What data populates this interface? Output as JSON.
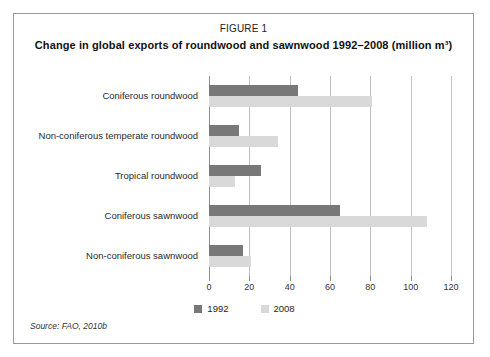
{
  "figure": {
    "number": "FIGURE 1",
    "title": "Change in global exports of roundwood and sawnwood 1992–2008 (million m³)",
    "source": "Source: FAO, 2010b"
  },
  "legend": {
    "items": [
      {
        "label": "1992",
        "color": "#787878"
      },
      {
        "label": "2008",
        "color": "#d9d9d9"
      }
    ]
  },
  "chart_data": {
    "type": "bar",
    "orientation": "horizontal",
    "title": "Change in global exports of roundwood and sawnwood 1992–2008 (million m³)",
    "xlabel": "",
    "ylabel": "",
    "xlim": [
      0,
      120
    ],
    "xticks": [
      0,
      20,
      40,
      60,
      80,
      100,
      120
    ],
    "xticklabels": [
      "0",
      "20",
      "40",
      "60",
      "80",
      "100",
      "120"
    ],
    "grid": true,
    "legend_position": "bottom",
    "categories": [
      "Coniferous roundwood",
      "Non-coniferous temperate roundwood",
      "Tropical roundwood",
      "Coniferous sawnwood",
      "Non-coniferous sawnwood"
    ],
    "series": [
      {
        "name": "1992",
        "color": "#787878",
        "values": [
          44,
          15,
          26,
          65,
          17
        ]
      },
      {
        "name": "2008",
        "color": "#d9d9d9",
        "values": [
          81,
          34,
          13,
          108,
          21
        ]
      }
    ]
  }
}
